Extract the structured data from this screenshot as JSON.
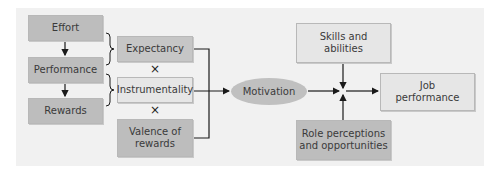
{
  "diagram": {
    "title_hidden": "",
    "left_chain": [
      {
        "id": "effort",
        "label": "Effort"
      },
      {
        "id": "performance",
        "label": "Performance"
      },
      {
        "id": "rewards",
        "label": "Rewards"
      }
    ],
    "factors": [
      {
        "id": "expectancy",
        "label": "Expectancy"
      },
      {
        "id": "instrumentality",
        "label": "Instrumentality"
      },
      {
        "id": "valence",
        "label_line1": "Valence of",
        "label_line2": "rewards"
      }
    ],
    "operator_symbol": "×",
    "motivation": {
      "label": "Motivation"
    },
    "skills": {
      "label_line1": "Skills and",
      "label_line2": "abilities"
    },
    "role": {
      "label_line1": "Role perceptions",
      "label_line2": "and opportunities"
    },
    "outcome": {
      "label_line1": "Job",
      "label_line2": "performance"
    },
    "colors": {
      "panel_bg": "#f1f1f1",
      "dark_box": "#bdbdbd",
      "light_box": "#e6e6e6",
      "line": "#1a1a1a"
    }
  }
}
